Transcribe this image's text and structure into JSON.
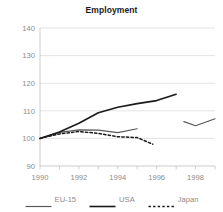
{
  "chart_data": {
    "type": "line",
    "title": "Employment",
    "xlabel": "",
    "ylabel": "",
    "xlim": [
      1990,
      1999
    ],
    "ylim": [
      90,
      140
    ],
    "yticks": [
      90,
      100,
      110,
      120,
      130,
      140
    ],
    "xticks": [
      1990,
      1992,
      1994,
      1996,
      1998
    ],
    "grid": true,
    "legend_position": "bottom",
    "series": [
      {
        "name": "EU-15",
        "color": "#595959",
        "style": "solid",
        "x": [
          1990,
          1991,
          1992,
          1993,
          1994,
          1995,
          1997.4,
          1998,
          1999
        ],
        "values": [
          100,
          102.2,
          103.1,
          103.0,
          102.1,
          103.5,
          106.1,
          104.6,
          107.1
        ],
        "gaps": [
          [
            1995,
            1997.4
          ]
        ]
      },
      {
        "name": "USA",
        "color": "#1a1a1a",
        "style": "solid",
        "x": [
          1990,
          1991,
          1992,
          1993,
          1994,
          1995,
          1996,
          1997
        ],
        "values": [
          100,
          102.3,
          105.5,
          109.3,
          111.3,
          112.6,
          113.7,
          116.0
        ]
      },
      {
        "name": "Japan",
        "color": "#1a1a1a",
        "style": "dashed",
        "x": [
          1990,
          1991,
          1992,
          1993,
          1994,
          1995,
          1995.8
        ],
        "values": [
          100,
          101.6,
          102.5,
          101.8,
          100.6,
          100.3,
          97.9
        ]
      }
    ]
  },
  "axis": {
    "ytick_labels": [
      "140",
      "130",
      "120",
      "110",
      "100",
      "90"
    ],
    "xtick_labels": [
      "1990",
      "1992",
      "1994",
      "1996",
      "1998"
    ]
  },
  "legend": {
    "items": [
      {
        "label": "EU-15",
        "color": "#595959",
        "style": "solid"
      },
      {
        "label": "USA",
        "color": "#1a1a1a",
        "style": "solid"
      },
      {
        "label": "Japan",
        "color": "#1a1a1a",
        "style": "dashed"
      }
    ]
  },
  "colors": {
    "grid": "#d9d9d9",
    "axis": "#bfbfbf",
    "tick_text": "#8c8c8c",
    "title_text": "#1a1a1a",
    "background": "#ffffff"
  }
}
